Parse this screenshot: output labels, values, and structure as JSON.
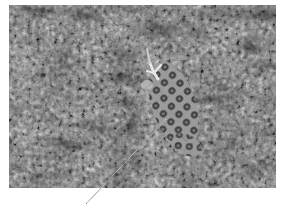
{
  "figure": {
    "style": "grayscale photograph",
    "annotation": {
      "type": "leader-line",
      "color": "#dcdcdc"
    },
    "colors": {
      "background": "#ffffff",
      "texture_dark": "#2e2e2e",
      "texture_mid": "#8a8a8a",
      "texture_light": "#d6d6d6"
    }
  }
}
